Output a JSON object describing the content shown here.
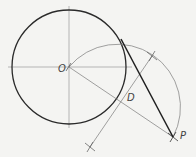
{
  "diagram": {
    "labels": {
      "center": "O",
      "midpoint": "D",
      "external_point": "P"
    },
    "colors": {
      "background": "#f4f4f2",
      "main_line": "#2a2a2a",
      "construction_line": "#7a7a7a"
    },
    "geometry": {
      "circle": {
        "cx": 69,
        "cy": 67,
        "r": 57
      },
      "point_O": {
        "x": 69,
        "y": 67
      },
      "point_P": {
        "x": 173,
        "y": 137
      },
      "point_D": {
        "x": 121,
        "y": 102
      },
      "tangent_point": {
        "x": 121,
        "y": 39
      },
      "construction_arc_radius": 63,
      "bisector_marks": [
        {
          "x": 152,
          "y": 56
        },
        {
          "x": 90,
          "y": 147
        }
      ]
    }
  }
}
